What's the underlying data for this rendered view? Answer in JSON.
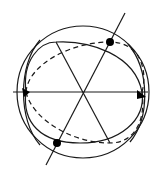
{
  "diagram": {
    "type": "sphere-great-circles",
    "colors": {
      "stroke": "#1a1a1a",
      "background": "#ffffff",
      "marker": "#000000"
    },
    "sphere": {
      "cx": 83,
      "cy": 92,
      "r": 66
    },
    "horizontal_axis": {
      "x1": 13,
      "y1": 92,
      "x2": 148,
      "y2": 92,
      "arrowheads": [
        "left",
        "right"
      ]
    },
    "tilted_axis": {
      "x1": 125,
      "y1": 13,
      "x2": 46,
      "y2": 165
    },
    "chord": {
      "x1": 56,
      "y1": 42,
      "x2": 110,
      "y2": 143
    },
    "marked_points": [
      {
        "name": "upper-point",
        "x": 110,
        "y": 42
      },
      {
        "name": "lower-point",
        "x": 57,
        "y": 143
      }
    ]
  }
}
